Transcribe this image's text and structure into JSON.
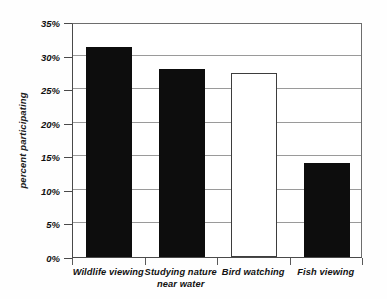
{
  "chart_data": {
    "type": "bar",
    "title": "",
    "subtitle": "",
    "xlabel": "",
    "ylabel": "percent participating",
    "categories": [
      "Wildlife viewing",
      "Studying nature near water",
      "Bird watching",
      "Fish viewing"
    ],
    "category_lines": [
      [
        "Wildlife viewing"
      ],
      [
        "Studying nature",
        "near water"
      ],
      [
        "Bird watching"
      ],
      [
        "Fish viewing"
      ]
    ],
    "values": [
      31.3,
      28.0,
      27.4,
      14.0
    ],
    "value_unit": "%",
    "bar_styles": [
      "filled",
      "filled",
      "hollow",
      "filled"
    ],
    "ylim": [
      0,
      35
    ],
    "ytick_values": [
      0,
      5,
      10,
      15,
      20,
      25,
      30,
      35
    ],
    "ytick_labels": [
      "0%",
      "5%",
      "10%",
      "15%",
      "20%",
      "25%",
      "30%",
      "35%"
    ],
    "grid": true,
    "grid_axis": "y",
    "legend": false,
    "legend_position": "none",
    "colors": {
      "bar_filled": "#0d0d0d",
      "bar_hollow_fill": "#ffffff",
      "bar_hollow_stroke": "#3d3d3d",
      "gridline": "#9a9a9a",
      "axis": "#4a4a4a",
      "text": "#111111",
      "background": "#ffffff"
    }
  }
}
